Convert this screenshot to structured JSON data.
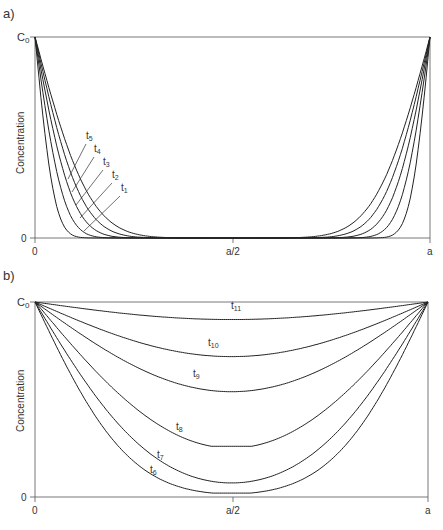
{
  "chart_data": [
    {
      "panel": "a)",
      "type": "line",
      "title": "",
      "xlabel": "",
      "ylabel": "Concentration",
      "x_ticks": [
        "0",
        "a/2",
        "a"
      ],
      "y_ticks": [
        "0",
        "C0"
      ],
      "xlim": [
        0,
        1
      ],
      "ylim": [
        0,
        1
      ],
      "grid": false,
      "legend": "inline labels",
      "series": [
        {
          "name": "t1",
          "label": "t",
          "sub": "1",
          "diffusion_length": 0.055
        },
        {
          "name": "t2",
          "label": "t",
          "sub": "2",
          "diffusion_length": 0.08
        },
        {
          "name": "t3",
          "label": "t",
          "sub": "3",
          "diffusion_length": 0.105
        },
        {
          "name": "t4",
          "label": "t",
          "sub": "4",
          "diffusion_length": 0.13
        },
        {
          "name": "t5",
          "label": "t",
          "sub": "5",
          "diffusion_length": 0.155
        }
      ]
    },
    {
      "panel": "b)",
      "type": "line",
      "title": "",
      "xlabel": "",
      "ylabel": "Concentration",
      "x_ticks": [
        "0",
        "a/2",
        "a"
      ],
      "y_ticks": [
        "0",
        "C0"
      ],
      "xlim": [
        0,
        1
      ],
      "ylim": [
        0,
        1
      ],
      "grid": false,
      "legend": "inline labels",
      "series": [
        {
          "name": "t6",
          "label": "t",
          "sub": "6",
          "center_value": 0.02
        },
        {
          "name": "t7",
          "label": "t",
          "sub": "7",
          "center_value": 0.06
        },
        {
          "name": "t8",
          "label": "t",
          "sub": "8",
          "center_value": 0.26
        },
        {
          "name": "t9",
          "label": "t",
          "sub": "9",
          "center_value": 0.54
        },
        {
          "name": "t10",
          "label": "t",
          "sub": "10",
          "center_value": 0.72
        },
        {
          "name": "t11",
          "label": "t",
          "sub": "11",
          "center_value": 0.91
        }
      ]
    }
  ],
  "panels": {
    "a": {
      "tag": "a)",
      "ylabel": "Concentration",
      "c0": "C",
      "c0_sub": "0",
      "y0": "0",
      "x0": "0",
      "xmid": "a/2",
      "xend": "a"
    },
    "b": {
      "tag": "b)",
      "ylabel": "Concentration",
      "c0": "C",
      "c0_sub": "0",
      "y0": "0",
      "x0": "0",
      "xmid": "a/2",
      "xend": "a"
    }
  }
}
